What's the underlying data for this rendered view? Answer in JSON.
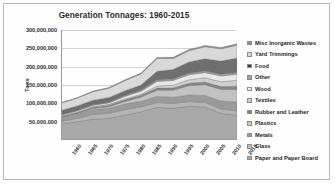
{
  "frame": {
    "border_color": "#b9b9b9",
    "background": "#fefefe"
  },
  "chart_data": {
    "type": "area",
    "stacked": true,
    "title": "Generation Tonnages: 1960-2015",
    "xlabel": "",
    "ylabel": "Tons",
    "ylim": [
      0,
      300000000
    ],
    "ytick_values": [
      50000000,
      100000000,
      150000000,
      200000000,
      250000000,
      300000000
    ],
    "ytick_labels": [
      "50,000,000",
      "100,000,000",
      "150,000,000",
      "200,000,000",
      "250,000,000",
      "300,000,000"
    ],
    "grid": true,
    "legend_position": "right",
    "categories": [
      1960,
      1965,
      1970,
      1975,
      1980,
      1985,
      1990,
      1995,
      2000,
      2005,
      2010,
      2015
    ],
    "xtick_labels": [
      "1960",
      "1965",
      "1970",
      "1975",
      "1980",
      "1985",
      "1990",
      "1995",
      "2000",
      "2005",
      "2010",
      "2015"
    ],
    "series": [
      {
        "name": "Paper and Paper Board",
        "color": "#a8a8a8",
        "values": [
          44000000,
          50000000,
          57000000,
          59000000,
          68000000,
          77000000,
          89000000,
          87000000,
          92000000,
          90000000,
          73000000,
          68000000
        ]
      },
      {
        "name": "Glass",
        "color": "#b4b4b4",
        "values": [
          6700000,
          8700000,
          12700000,
          13500000,
          15000000,
          13200000,
          13100000,
          12800000,
          12800000,
          12500000,
          11500000,
          11400000
        ]
      },
      {
        "name": "Metals",
        "color": "#9b9b9b",
        "values": [
          10800000,
          12400000,
          13800000,
          14000000,
          15500000,
          15300000,
          16600000,
          17000000,
          18000000,
          19000000,
          22000000,
          24000000
        ]
      },
      {
        "name": "Plastics",
        "color": "#c2c2c2",
        "values": [
          390000,
          1400000,
          2900000,
          4400000,
          6800000,
          11600000,
          17100000,
          18900000,
          25500000,
          29400000,
          31400000,
          34500000
        ]
      },
      {
        "name": "Rubber and Leather",
        "color": "#878787",
        "values": [
          1840000,
          2200000,
          2970000,
          4200000,
          4200000,
          4700000,
          5800000,
          6100000,
          6700000,
          7300000,
          7800000,
          9000000
        ]
      },
      {
        "name": "Textiles",
        "color": "#cfcfcf",
        "values": [
          1760000,
          1930000,
          2040000,
          2200000,
          2500000,
          2900000,
          5800000,
          7400000,
          9500000,
          11500000,
          13100000,
          16000000
        ]
      },
      {
        "name": "Wood",
        "color": "#e8e8e8",
        "values": [
          3030000,
          3300000,
          3700000,
          4200000,
          7000000,
          8200000,
          12200000,
          13300000,
          13500000,
          14000000,
          15900000,
          16300000
        ]
      },
      {
        "name": "Other",
        "color": "#9f9f9f",
        "values": [
          70000,
          300000,
          770000,
          1200000,
          2500000,
          3300000,
          3800000,
          4100000,
          4300000,
          4600000,
          4700000,
          4900000
        ]
      },
      {
        "name": "Food",
        "color": "#6f6f6f",
        "values": [
          12200000,
          12700000,
          12800000,
          13400000,
          13000000,
          13800000,
          23900000,
          25900000,
          30700000,
          33300000,
          35800000,
          39700000
        ]
      },
      {
        "name": "Yard Trimmings",
        "color": "#d9d9d9",
        "values": [
          20000000,
          21000000,
          23200000,
          25200000,
          27500000,
          30000000,
          35000000,
          29800000,
          30500000,
          32900000,
          33400000,
          34700000
        ]
      },
      {
        "name": "Misc Inorganic Wastes",
        "color": "#8f8f8f",
        "values": [
          1300000,
          1500000,
          1780000,
          2100000,
          2250000,
          2500000,
          2900000,
          3100000,
          3300000,
          3500000,
          3700000,
          3900000
        ]
      }
    ],
    "legend_entries": [
      {
        "label": "Misc Inorganic Wastes",
        "color": "#8f8f8f"
      },
      {
        "label": "Yard Trimmings",
        "color": "#d9d9d9"
      },
      {
        "label": "Food",
        "color": "#3c3c3c"
      },
      {
        "label": "Other",
        "color": "#9f9f9f"
      },
      {
        "label": "Wood",
        "color": "#ececec"
      },
      {
        "label": "Textiles",
        "color": "#cfcfcf"
      },
      {
        "label": "Rubber and Leather",
        "color": "#7d7d7d"
      },
      {
        "label": "Plastics",
        "color": "#c6c6c6"
      },
      {
        "label": "Metals",
        "color": "#9b9b9b"
      },
      {
        "label": "Glass",
        "color": "#bdbdbd"
      },
      {
        "label": "Paper and Paper Board",
        "color": "#a8a8a8"
      }
    ]
  }
}
